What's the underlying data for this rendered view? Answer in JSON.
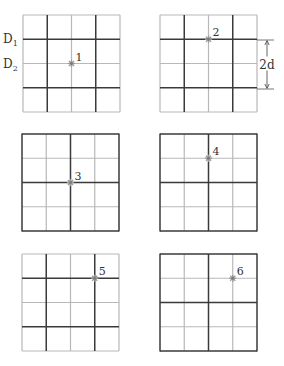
{
  "figure": {
    "colors": {
      "background": "#ffffff",
      "light_line": "#b8b8b8",
      "dark_line": "#3a3a3a",
      "marker": "#9a9a9a",
      "text": "#333333"
    },
    "row_labels": [
      {
        "id": "D1",
        "base": "D",
        "sub": "1",
        "x": 3,
        "y": 43
      },
      {
        "id": "D2",
        "base": "D",
        "sub": "2",
        "x": 3,
        "y": 68
      }
    ],
    "dimension": {
      "label": "2d",
      "x": 267,
      "y_top": 40,
      "y_bottom": 89,
      "ext_x1": 257,
      "ext_x2": 274
    },
    "panels": [
      {
        "id": 1,
        "label": "1",
        "x0": 23,
        "y0": 15,
        "size": 97,
        "dark_v": [
          1,
          3
        ],
        "dark_h": [
          1,
          3
        ],
        "dark_border": false,
        "marker": {
          "col": 2,
          "row": 2
        }
      },
      {
        "id": 2,
        "label": "2",
        "x0": 160,
        "y0": 15,
        "size": 97,
        "dark_v": [
          1,
          3
        ],
        "dark_h": [
          1,
          3
        ],
        "dark_border": false,
        "marker": {
          "col": 2,
          "row": 1
        }
      },
      {
        "id": 3,
        "label": "3",
        "x0": 22,
        "y0": 134,
        "size": 97,
        "dark_v": [
          2
        ],
        "dark_h": [
          2
        ],
        "dark_border": true,
        "marker": {
          "col": 2,
          "row": 2
        }
      },
      {
        "id": 4,
        "label": "4",
        "x0": 160,
        "y0": 134,
        "size": 97,
        "dark_v": [
          2
        ],
        "dark_h": [
          2
        ],
        "dark_border": true,
        "marker": {
          "col": 2,
          "row": 1
        }
      },
      {
        "id": 5,
        "label": "5",
        "x0": 22,
        "y0": 254,
        "size": 97,
        "dark_v": [
          1,
          3
        ],
        "dark_h": [
          1,
          3
        ],
        "dark_border": false,
        "marker": {
          "col": 3,
          "row": 1
        }
      },
      {
        "id": 6,
        "label": "6",
        "x0": 160,
        "y0": 254,
        "size": 97,
        "dark_v": [
          2
        ],
        "dark_h": [
          2
        ],
        "dark_border": true,
        "marker": {
          "col": 3,
          "row": 1
        }
      }
    ]
  }
}
